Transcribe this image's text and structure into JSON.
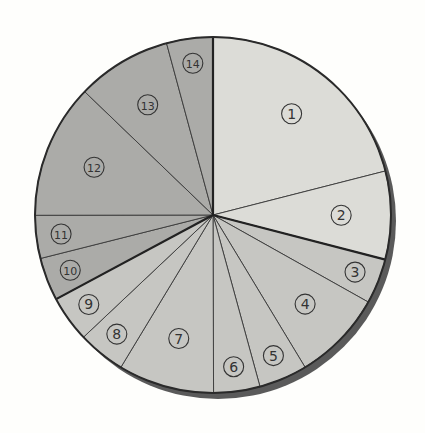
{
  "chart_data": {
    "type": "pie",
    "title": "",
    "start_angle_deg": 0,
    "direction": "clockwise",
    "categories": [
      "①",
      "②",
      "③",
      "④",
      "⑤",
      "⑥",
      "⑦",
      "⑧",
      "⑨",
      "⑩",
      "⑪",
      "⑫",
      "⑬",
      "⑭"
    ],
    "values": [
      21.0,
      8.0,
      4.1,
      8.2,
      4.4,
      4.2,
      8.7,
      4.3,
      4.2,
      3.9,
      3.9,
      12.2,
      8.6,
      4.2
    ],
    "groups": [
      {
        "name": "group-a",
        "members": [
          "①",
          "②"
        ],
        "color": "#dcdcd7"
      },
      {
        "name": "group-b",
        "members": [
          "③",
          "④",
          "⑤",
          "⑥",
          "⑦",
          "⑧",
          "⑨"
        ],
        "color": "#c6c6c2"
      },
      {
        "name": "group-c",
        "members": [
          "⑩",
          "⑪",
          "⑫",
          "⑬",
          "⑭"
        ],
        "color": "#ababa8"
      }
    ],
    "legend": "none",
    "labels_inside": true
  },
  "style": {
    "background": "#fefefc",
    "shadow": "#555555",
    "outline": "#2a2a2a"
  }
}
